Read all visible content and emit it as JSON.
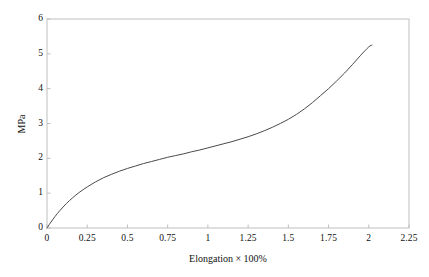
{
  "chart_data": {
    "type": "line",
    "title": "",
    "subtitle": "",
    "xlabel": "Elongation × 100%",
    "ylabel": "MPa",
    "xlim": [
      0,
      2.25
    ],
    "ylim": [
      0,
      6
    ],
    "grid": false,
    "legend": null,
    "frame": "box",
    "x_ticks": [
      0,
      0.25,
      0.5,
      0.75,
      1,
      1.25,
      1.5,
      1.75,
      2,
      2.25
    ],
    "x_tick_labels": [
      "0",
      "0.25",
      "0.5",
      "0.75",
      "1",
      "1.25",
      "1.5",
      "1.75",
      "2",
      "2.25"
    ],
    "y_ticks": [
      0,
      1,
      2,
      3,
      4,
      5,
      6
    ],
    "y_tick_labels": [
      "0",
      "1",
      "2",
      "3",
      "4",
      "5",
      "6"
    ],
    "series": [
      {
        "name": "stress-strain",
        "color": "#4a4a4a",
        "line_width": 1,
        "x": [
          0,
          0.02,
          0.05,
          0.08,
          0.12,
          0.16,
          0.2,
          0.25,
          0.3,
          0.35,
          0.4,
          0.45,
          0.5,
          0.55,
          0.6,
          0.65,
          0.7,
          0.75,
          0.8,
          0.85,
          0.9,
          0.95,
          1.0,
          1.05,
          1.1,
          1.15,
          1.2,
          1.25,
          1.3,
          1.35,
          1.4,
          1.45,
          1.5,
          1.55,
          1.6,
          1.65,
          1.7,
          1.75,
          1.8,
          1.85,
          1.9,
          1.95,
          2.0,
          2.02
        ],
        "y": [
          0,
          0.14,
          0.33,
          0.5,
          0.7,
          0.87,
          1.02,
          1.18,
          1.32,
          1.44,
          1.54,
          1.63,
          1.71,
          1.78,
          1.85,
          1.91,
          1.97,
          2.03,
          2.08,
          2.13,
          2.19,
          2.24,
          2.3,
          2.36,
          2.42,
          2.48,
          2.55,
          2.62,
          2.7,
          2.79,
          2.89,
          3.0,
          3.12,
          3.26,
          3.42,
          3.6,
          3.8,
          4.0,
          4.22,
          4.45,
          4.7,
          4.96,
          5.2,
          5.25
        ]
      }
    ],
    "axis_color": "#bfbfbf",
    "tick_color": "#bfbfbf",
    "text_color": "#111111",
    "background": "#ffffff"
  },
  "axes": {
    "x_title": "Elongation × 100%",
    "y_title": "MPa"
  },
  "x_tick_labels": [
    "0",
    "0.25",
    "0.5",
    "0.75",
    "1",
    "1.25",
    "1.5",
    "1.75",
    "2",
    "2.25"
  ],
  "y_tick_labels": [
    "0",
    "1",
    "2",
    "3",
    "4",
    "5",
    "6"
  ]
}
